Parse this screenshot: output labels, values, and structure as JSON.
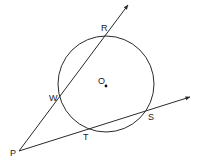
{
  "diagram": {
    "type": "geometry-secants",
    "stroke_color": "#2a2a2a",
    "circle": {
      "center_label": "O",
      "cx": 106,
      "cy": 84,
      "r": 48
    },
    "points": {
      "P": {
        "label": "P",
        "x": 19,
        "y": 151
      },
      "W": {
        "label": "W",
        "x": 59,
        "y": 98
      },
      "R": {
        "label": "R",
        "x": 105,
        "y": 34
      },
      "T": {
        "label": "T",
        "x": 87,
        "y": 128
      },
      "S": {
        "label": "S",
        "x": 148,
        "y": 110
      },
      "O": {
        "label": "O",
        "x": 105,
        "y": 85
      }
    },
    "rays": [
      {
        "name": "ray-PR",
        "from": "P",
        "through": [
          "W",
          "R"
        ],
        "tip": {
          "x": 128,
          "y": 5
        }
      },
      {
        "name": "ray-PS",
        "from": "P",
        "through": [
          "T",
          "S"
        ],
        "tip": {
          "x": 190,
          "y": 97
        }
      }
    ]
  }
}
